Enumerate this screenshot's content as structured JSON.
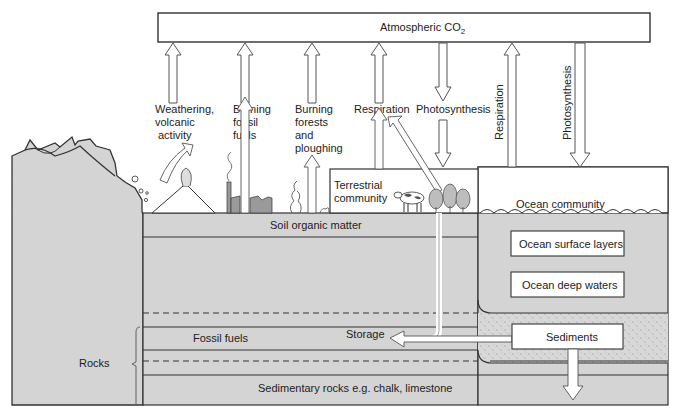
{
  "atmosphere": {
    "label": "Atmospheric CO",
    "subscript": "2"
  },
  "processes": {
    "weathering": [
      "Weathering,",
      "volcanic",
      "activity"
    ],
    "burning_fossil": [
      "Burning",
      "fossil",
      "fuels"
    ],
    "burning_forests": [
      "Burning",
      "forests",
      "and",
      "ploughing"
    ],
    "respiration_land": "Respiration",
    "photosynthesis_land": "Photosynthesis",
    "respiration_ocean": "Respiration",
    "photosynthesis_ocean": "Photosynthesis"
  },
  "reservoirs": {
    "terrestrial": [
      "Terrestrial",
      "community"
    ],
    "soil": "Soil organic matter",
    "fossil_fuels": "Fossil fuels",
    "storage": "Storage",
    "sedimentary": "Sedimentary rocks e.g. chalk, limestone",
    "rocks": "Rocks",
    "ocean_community": "Ocean community",
    "ocean_surface": "Ocean surface layers",
    "ocean_deep": "Ocean deep waters",
    "sediments": "Sediments"
  },
  "colors": {
    "ground": "#d4d4d4",
    "stroke": "#333333",
    "box": "#ffffff",
    "dark_fill": "#9a9a9a"
  }
}
